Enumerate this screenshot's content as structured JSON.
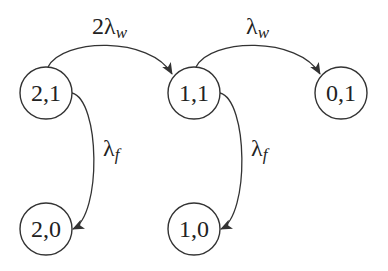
{
  "diagram": {
    "type": "state-transition",
    "nodes": [
      {
        "id": "n21",
        "label": "2,1"
      },
      {
        "id": "n11",
        "label": "1,1"
      },
      {
        "id": "n01",
        "label": "0,1"
      },
      {
        "id": "n20",
        "label": "2,0"
      },
      {
        "id": "n10",
        "label": "1,0"
      }
    ],
    "edges": [
      {
        "from": "2,1",
        "to": "1,1",
        "label_main": "2λ",
        "label_sub": "w"
      },
      {
        "from": "1,1",
        "to": "0,1",
        "label_main": "λ",
        "label_sub": "w"
      },
      {
        "from": "2,1",
        "to": "2,0",
        "label_main": "λ",
        "label_sub": "f"
      },
      {
        "from": "1,1",
        "to": "1,0",
        "label_main": "λ",
        "label_sub": "f"
      }
    ],
    "colors": {
      "stroke": "#333333",
      "text": "#222222",
      "background": "#ffffff"
    }
  }
}
